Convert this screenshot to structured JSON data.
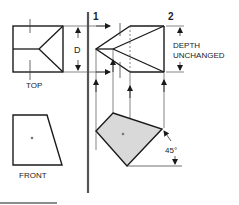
{
  "labels": {
    "plane_1": "1",
    "plane_2": "2",
    "dimension_d": "D",
    "depth_line1": "DEPTH",
    "depth_line2": "UNCHANGED",
    "top_view": "TOP",
    "front_view": "FRONT",
    "angle": "45°"
  },
  "colors": {
    "line": "#1a1a1a",
    "thin_line": "#333333",
    "fill_rotated": "#d9d9d9"
  }
}
